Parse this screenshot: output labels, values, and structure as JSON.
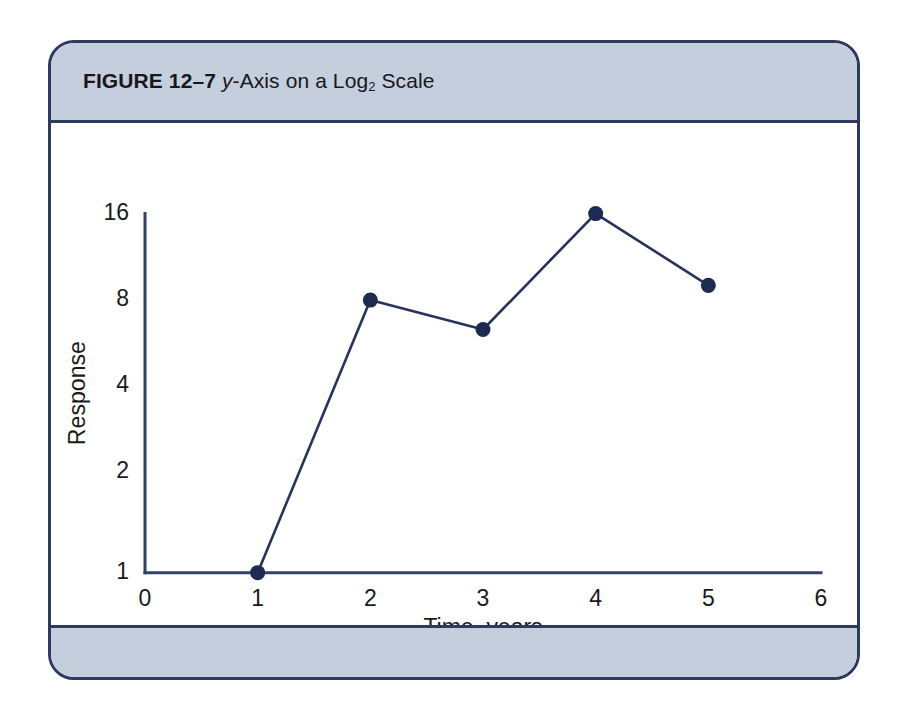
{
  "figure": {
    "number": "FIGURE 12–7",
    "title_italic": "y",
    "title_rest_a": "-Axis on a Log",
    "title_sub": "2",
    "title_rest_b": " Scale",
    "border_color": "#2b3a5e",
    "band_color": "#c5cedd"
  },
  "chart_data": {
    "type": "line",
    "title": "",
    "xlabel": "Time, years",
    "ylabel": "Response",
    "x": [
      1,
      2,
      3,
      4,
      5
    ],
    "values": [
      1,
      8,
      6.3,
      16,
      9
    ],
    "series": [
      {
        "name": "Response",
        "values": [
          1,
          8,
          6.3,
          16,
          9
        ]
      }
    ],
    "xlim": [
      0,
      6
    ],
    "ylim": [
      1,
      16
    ],
    "yscale": "log2",
    "xticks": [
      "0",
      "1",
      "2",
      "3",
      "4",
      "5",
      "6"
    ],
    "xtick_values": [
      0,
      1,
      2,
      3,
      4,
      5,
      6
    ],
    "yticks": [
      "1",
      "2",
      "4",
      "8",
      "16"
    ],
    "ytick_values": [
      1,
      2,
      4,
      8,
      16
    ],
    "grid": false,
    "legend": "none",
    "line_color": "#27335c",
    "marker_color": "#1d2a52",
    "axis_color": "#32406a"
  }
}
